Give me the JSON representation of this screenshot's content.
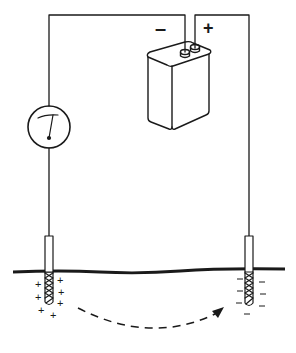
{
  "diagram": {
    "battery": {
      "negative_label": "–",
      "positive_label": "+"
    },
    "meter": {
      "icon": "meter-dial-icon"
    },
    "left_electrode": {
      "charge_symbol": "+",
      "charge_count": 7
    },
    "right_electrode": {
      "charge_symbol": "–",
      "charge_count": 7
    },
    "flow_arrow": {
      "style": "dashed",
      "direction": "left-to-right"
    },
    "colors": {
      "ink": "#1a1a1a",
      "background": "#ffffff"
    }
  }
}
